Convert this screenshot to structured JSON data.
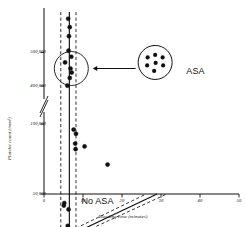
{
  "chart_data": {
    "type": "scatter",
    "title": "",
    "xlabel": "Bleeding time (minutes)",
    "ylabel": "Platelet count (/mm³)",
    "xlim": [
      0,
      50
    ],
    "xticks": [
      0,
      10,
      20,
      30,
      40,
      50
    ],
    "xticklabels": [
      "0",
      "10",
      "20",
      "30",
      "40",
      "50"
    ],
    "yticks": [
      50000,
      100000,
      400000,
      500000
    ],
    "yticklabels": [
      "50,000",
      "100,000",
      "400,000",
      "500,000"
    ],
    "y_axis_break": true,
    "y_axis_break_between": [
      100000,
      400000
    ],
    "grid": false,
    "legend_position": "upper-right-inset",
    "series": [
      {
        "name": "No ASA",
        "marker": "filled-circle",
        "color": "#111111",
        "points": [
          {
            "x": 6.2,
            "y": 600000
          },
          {
            "x": 6.6,
            "y": 575000
          },
          {
            "x": 6.4,
            "y": 548000
          },
          {
            "x": 6.3,
            "y": 505000
          },
          {
            "x": 7.0,
            "y": 487000
          },
          {
            "x": 5.4,
            "y": 470000
          },
          {
            "x": 6.8,
            "y": 452000
          },
          {
            "x": 7.1,
            "y": 440000
          },
          {
            "x": 6.6,
            "y": 424000
          },
          {
            "x": 6.0,
            "y": 401000
          },
          {
            "x": 5.2,
            "y": 360000
          },
          {
            "x": 5.1,
            "y": 340000
          },
          {
            "x": 6.3,
            "y": 310000
          },
          {
            "x": 6.1,
            "y": 180000
          },
          {
            "x": 6.4,
            "y": 140000
          },
          {
            "x": 7.6,
            "y": 96000
          },
          {
            "x": 8.2,
            "y": 93000
          },
          {
            "x": 8.0,
            "y": 86000
          },
          {
            "x": 8.1,
            "y": 82000
          },
          {
            "x": 10.4,
            "y": 84000
          },
          {
            "x": 16.3,
            "y": 71000
          }
        ]
      }
    ],
    "fit_line": {
      "style": "solid",
      "color": "#111111",
      "segments": [
        {
          "x1": 6.5,
          "y1": 620000,
          "x2": 6.5,
          "y2": 103000
        },
        {
          "x1": 6.5,
          "y1": 103000,
          "x2": 29.0,
          "y2": 50000
        }
      ]
    },
    "confidence_bands": {
      "style": "dashed",
      "color": "#111111",
      "upper": [
        {
          "x1": 4.3,
          "y1": 620000,
          "x2": 4.3,
          "y2": 103000
        },
        {
          "x1": 4.3,
          "y1": 103000,
          "x2": 26.2,
          "y2": 50000
        }
      ],
      "lower": [
        {
          "x1": 8.2,
          "y1": 620000,
          "x2": 8.2,
          "y2": 103000
        },
        {
          "x1": 8.2,
          "y1": 103000,
          "x2": 31.5,
          "y2": 50000
        }
      ]
    },
    "annotations": [
      {
        "name": "no-asa-label",
        "text": "No ASA",
        "x": 9.6,
        "y": 372000
      },
      {
        "name": "asa-label",
        "text": "ASA",
        "x": 36.5,
        "y": 442000
      },
      {
        "name": "no-asa-circle",
        "type": "ellipse",
        "cx": 7.0,
        "cy": 452000
      },
      {
        "name": "asa-legend-circle",
        "type": "ellipse",
        "cx": 28.5,
        "cy": 470000,
        "dots": 7
      },
      {
        "name": "pointer-arrow",
        "type": "arrow",
        "from_x": 23.5,
        "from_y": 452000,
        "to_x": 12.5,
        "to_y": 452000
      }
    ]
  },
  "axis": {
    "x_title": "Bleeding time (minutes)",
    "y_title": "Platelet count (/mm³)",
    "x_tick_0": "0",
    "x_tick_1": "10",
    "x_tick_2": "20",
    "x_tick_3": "30",
    "x_tick_4": "40",
    "x_tick_5": "50",
    "y_tick_0": "50,000",
    "y_tick_1": "100,000",
    "y_tick_2": "400,000",
    "y_tick_3": "500,000"
  },
  "labels": {
    "no_asa": "No ASA",
    "asa": "ASA"
  },
  "colors": {
    "ink": "#111111",
    "background": "#ffffff"
  }
}
